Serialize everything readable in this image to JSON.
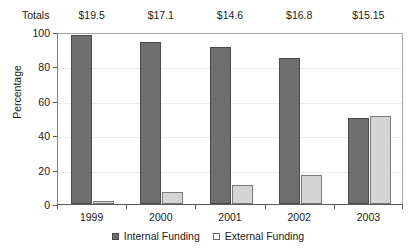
{
  "chart_data": {
    "type": "bar",
    "title": "",
    "xlabel": "",
    "ylabel": "Percentage",
    "ylim": [
      0,
      100
    ],
    "yticks": [
      0,
      20,
      40,
      60,
      80,
      100
    ],
    "grid": true,
    "legend_position": "bottom",
    "categories": [
      "1999",
      "2000",
      "2001",
      "2002",
      "2003"
    ],
    "series": [
      {
        "name": "Internal Funding",
        "color": "#6e6e6e",
        "values": [
          98,
          94,
          91,
          85,
          50
        ]
      },
      {
        "name": "External Funding",
        "color": "#d4d4d4",
        "values": [
          2,
          7,
          11,
          17,
          51
        ]
      }
    ],
    "annotations": {
      "totals_row_label": "Totals",
      "totals": [
        "$19.5",
        "$17.1",
        "$14.6",
        "$16.8",
        "$15.15"
      ]
    }
  },
  "axis": {
    "y_title": "Percentage",
    "y_tick_labels": [
      "100",
      "80",
      "60",
      "40",
      "20",
      "0"
    ],
    "x_tick_labels": [
      "1999",
      "2000",
      "2001",
      "2002",
      "2003"
    ]
  },
  "totals": {
    "label": "Totals",
    "values": [
      "$19.5",
      "$17.1",
      "$14.6",
      "$16.8",
      "$15.15"
    ]
  },
  "legend": {
    "items": [
      {
        "label": "Internal Funding",
        "swatch": "internal"
      },
      {
        "label": "External Funding",
        "swatch": "external"
      }
    ]
  },
  "colors": {
    "internal_bar": "#6e6e6e",
    "internal_bar_border": "#4a4a4a",
    "external_bar": "#d4d4d4",
    "external_bar_border": "#7a7a7a",
    "gridline": "#ececec",
    "axis": "#595959",
    "background": "#ffffff"
  }
}
